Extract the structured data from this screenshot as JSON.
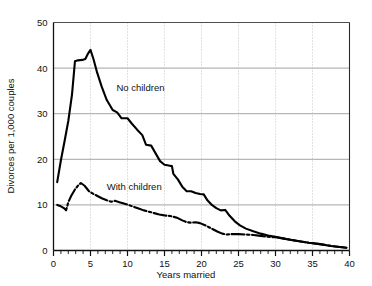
{
  "chart_data": {
    "type": "line",
    "title": "",
    "xlabel": "Years married",
    "ylabel": "Divorces per 1,000 couples",
    "xlim": [
      0,
      40
    ],
    "ylim": [
      0,
      50
    ],
    "xticks": [
      0,
      5,
      10,
      15,
      20,
      25,
      30,
      35,
      40
    ],
    "xtick_labels": [
      "0",
      "5",
      "10",
      "15",
      "20",
      "25",
      "30",
      "35",
      "40"
    ],
    "xminor_tick_step": 1,
    "yticks": [
      0,
      10,
      20,
      30,
      40,
      50
    ],
    "ytick_labels": [
      "0",
      "10",
      "20",
      "30",
      "40",
      "50"
    ],
    "grid": "horizontal-solid-and-vertical-dotted-at-major-xticks",
    "legend": "inline-annotations",
    "series": [
      {
        "name": "No children",
        "style": "solid",
        "color": "#000000",
        "label_x": 8.5,
        "label_y": 35.0,
        "points": [
          [
            0.5,
            15.0
          ],
          [
            1.0,
            19.8
          ],
          [
            1.5,
            24.0
          ],
          [
            2.0,
            28.4
          ],
          [
            2.5,
            34.2
          ],
          [
            2.9,
            41.5
          ],
          [
            3.3,
            41.7
          ],
          [
            3.9,
            41.8
          ],
          [
            4.3,
            42.0
          ],
          [
            4.6,
            43.0
          ],
          [
            5.0,
            44.0
          ],
          [
            5.4,
            42.0
          ],
          [
            5.9,
            39.0
          ],
          [
            6.5,
            36.0
          ],
          [
            7.2,
            33.0
          ],
          [
            8.0,
            30.8
          ],
          [
            8.6,
            30.3
          ],
          [
            9.2,
            29.0
          ],
          [
            10.0,
            29.0
          ],
          [
            10.6,
            27.8
          ],
          [
            11.3,
            26.5
          ],
          [
            12.0,
            25.3
          ],
          [
            12.5,
            23.2
          ],
          [
            13.2,
            23.0
          ],
          [
            13.8,
            21.3
          ],
          [
            14.4,
            19.6
          ],
          [
            15.0,
            18.8
          ],
          [
            15.4,
            18.7
          ],
          [
            15.7,
            18.6
          ],
          [
            16.0,
            18.5
          ],
          [
            16.2,
            16.8
          ],
          [
            16.8,
            15.6
          ],
          [
            17.4,
            14.0
          ],
          [
            18.0,
            13.0
          ],
          [
            18.6,
            13.0
          ],
          [
            19.2,
            12.6
          ],
          [
            19.8,
            12.4
          ],
          [
            20.3,
            12.3
          ],
          [
            20.8,
            11.0
          ],
          [
            21.4,
            10.0
          ],
          [
            22.0,
            9.3
          ],
          [
            22.6,
            8.8
          ],
          [
            23.2,
            8.9
          ],
          [
            23.8,
            7.6
          ],
          [
            24.5,
            6.4
          ],
          [
            25.2,
            5.5
          ],
          [
            26.0,
            4.8
          ],
          [
            27.0,
            4.2
          ],
          [
            28.0,
            3.7
          ],
          [
            29.0,
            3.3
          ],
          [
            30.0,
            3.0
          ],
          [
            31.5,
            2.5
          ],
          [
            33.0,
            2.1
          ],
          [
            34.5,
            1.7
          ],
          [
            36.0,
            1.4
          ],
          [
            37.5,
            1.0
          ],
          [
            39.0,
            0.7
          ],
          [
            39.6,
            0.6
          ]
        ]
      },
      {
        "name": "With children",
        "style": "dash-dot",
        "color": "#000000",
        "label_x": 7.2,
        "label_y": 13.3,
        "points": [
          [
            0.5,
            10.0
          ],
          [
            1.0,
            9.7
          ],
          [
            1.4,
            9.3
          ],
          [
            1.7,
            8.8
          ],
          [
            2.0,
            10.6
          ],
          [
            2.4,
            12.0
          ],
          [
            2.9,
            13.4
          ],
          [
            3.3,
            14.2
          ],
          [
            3.7,
            14.8
          ],
          [
            4.2,
            14.2
          ],
          [
            4.8,
            13.0
          ],
          [
            5.4,
            12.4
          ],
          [
            6.0,
            11.9
          ],
          [
            6.6,
            11.4
          ],
          [
            7.2,
            11.0
          ],
          [
            7.8,
            10.7
          ],
          [
            8.3,
            10.9
          ],
          [
            8.9,
            10.6
          ],
          [
            9.5,
            10.3
          ],
          [
            10.1,
            10.0
          ],
          [
            10.8,
            9.6
          ],
          [
            11.5,
            9.2
          ],
          [
            12.2,
            8.8
          ],
          [
            12.9,
            8.5
          ],
          [
            13.6,
            8.2
          ],
          [
            14.3,
            7.9
          ],
          [
            15.0,
            7.7
          ],
          [
            15.6,
            7.6
          ],
          [
            16.2,
            7.4
          ],
          [
            16.8,
            7.1
          ],
          [
            17.4,
            6.6
          ],
          [
            18.0,
            6.2
          ],
          [
            18.6,
            6.1
          ],
          [
            19.2,
            6.2
          ],
          [
            19.8,
            6.0
          ],
          [
            20.4,
            5.6
          ],
          [
            21.0,
            5.1
          ],
          [
            21.6,
            4.6
          ],
          [
            22.2,
            4.1
          ],
          [
            22.8,
            3.7
          ],
          [
            23.4,
            3.5
          ],
          [
            24.2,
            3.6
          ],
          [
            25.0,
            3.6
          ],
          [
            26.0,
            3.5
          ],
          [
            27.0,
            3.4
          ],
          [
            28.0,
            3.2
          ],
          [
            29.0,
            3.0
          ],
          [
            30.0,
            2.9
          ],
          [
            31.5,
            2.5
          ],
          [
            33.0,
            2.1
          ],
          [
            34.5,
            1.7
          ],
          [
            36.0,
            1.4
          ],
          [
            37.5,
            1.0
          ],
          [
            39.0,
            0.7
          ],
          [
            39.6,
            0.6
          ]
        ]
      }
    ]
  }
}
